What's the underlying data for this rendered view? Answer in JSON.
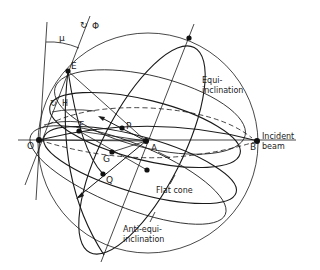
{
  "figure": {
    "points": {
      "O": "O",
      "A": "A",
      "B": "B",
      "E": "E",
      "F": "F",
      "P": "P",
      "G": "G",
      "Q": "Q"
    },
    "angles": {
      "mu": "μ",
      "phi": "Φ",
      "H": "H"
    },
    "annotations": {
      "equi_line1": "Equi-",
      "equi_line2": "inclination",
      "incident_line1": "Incident",
      "incident_line2": "beam",
      "flat_cone": "Flat cone",
      "anti_line1": "Anti-equi-",
      "anti_line2": "inclination"
    },
    "colors": {
      "ink": "#1a1a1a",
      "background": "#ffffff"
    }
  }
}
